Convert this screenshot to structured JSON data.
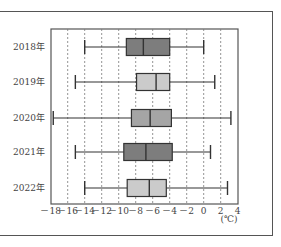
{
  "chart_data": {
    "type": "boxplot",
    "orientation": "horizontal",
    "title": "",
    "xlabel": "",
    "unit": "(℃)",
    "xlim": [
      -18,
      4
    ],
    "x_ticks": [
      -18,
      -16,
      -14,
      -12,
      -10,
      -8,
      -6,
      -4,
      -2,
      0,
      2,
      4
    ],
    "x_tick_labels": [
      "－18",
      "－16",
      "－14",
      "－12",
      "－10",
      "－8",
      "－6",
      "－4",
      "－2",
      "0",
      "2",
      "4"
    ],
    "grid": "vertical dashed",
    "categories": [
      "2018年",
      "2019年",
      "2020年",
      "2021年",
      "2022年"
    ],
    "series": [
      {
        "name": "2018年",
        "min": -14.0,
        "q1": -9.1,
        "median": -7.1,
        "q3": -4.0,
        "max": 0.0,
        "color": "#7d7d7d"
      },
      {
        "name": "2019年",
        "min": -15.1,
        "q1": -7.9,
        "median": -5.6,
        "q3": -4.0,
        "max": 1.3,
        "color": "#cbcbcb"
      },
      {
        "name": "2020年",
        "min": -17.7,
        "q1": -8.5,
        "median": -6.3,
        "q3": -3.8,
        "max": 3.2,
        "color": "#a5a5a5"
      },
      {
        "name": "2021年",
        "min": -15.1,
        "q1": -9.4,
        "median": -6.8,
        "q3": -3.7,
        "max": 0.8,
        "color": "#7d7d7d"
      },
      {
        "name": "2022年",
        "min": -14.0,
        "q1": -9.0,
        "median": -6.4,
        "q3": -4.4,
        "max": 2.8,
        "color": "#cbcbcb"
      }
    ]
  }
}
